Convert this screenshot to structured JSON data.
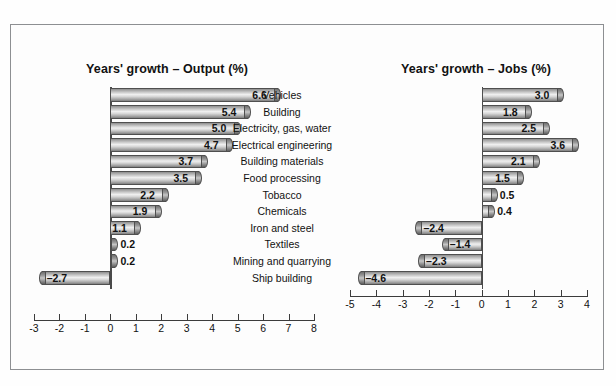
{
  "figure": {
    "background_color": "#fdfdfd",
    "frame_color": "#8d8f92",
    "bar_fill": "#cfcfcf",
    "bar_outline": "#4f4f4f"
  },
  "chart_data": [
    {
      "type": "bar",
      "orientation": "horizontal",
      "title": "Years' growth – Output (%)",
      "xlabel": "",
      "ylabel": "",
      "xlim": [
        -3,
        8
      ],
      "xticks": [
        "-3",
        "-2",
        "-1",
        "0",
        "1",
        "2",
        "3",
        "4",
        "5",
        "6",
        "7",
        "8"
      ],
      "xtick_values": [
        -3,
        -2,
        -1,
        0,
        1,
        2,
        3,
        4,
        5,
        6,
        7,
        8
      ],
      "grid": false,
      "legend": "none",
      "categories": [
        "Vehicles",
        "Building",
        "Electricity, gas, water",
        "Electrical engineering",
        "Building materials",
        "Food processing",
        "Tobacco",
        "Chemicals",
        "Iron and steel",
        "Textiles",
        "Mining and quarrying",
        "Ship building"
      ],
      "values": [
        6.6,
        5.4,
        5.0,
        4.7,
        3.7,
        3.5,
        2.2,
        1.9,
        1.1,
        0.2,
        0.2,
        -2.7
      ],
      "data_labels": [
        "6.6",
        "5.4",
        "5.0",
        "4.7",
        "3.7",
        "3.5",
        "2.2",
        "1.9",
        "1.1",
        "0.2",
        "0.2",
        "–2.7"
      ]
    },
    {
      "type": "bar",
      "orientation": "horizontal",
      "title": "Years' growth – Jobs (%)",
      "xlabel": "",
      "ylabel": "",
      "xlim": [
        -5,
        4
      ],
      "xticks": [
        "-5",
        "-4",
        "-3",
        "-2",
        "-1",
        "0",
        "1",
        "2",
        "3",
        "4"
      ],
      "xtick_values": [
        -5,
        -4,
        -3,
        -2,
        -1,
        0,
        1,
        2,
        3,
        4
      ],
      "grid": false,
      "legend": "none",
      "categories": [
        "Vehicles",
        "Building",
        "Electricity, gas, water",
        "Electrical engineering",
        "Building materials",
        "Food processing",
        "Tobacco",
        "Chemicals",
        "Iron and steel",
        "Textiles",
        "Mining and quarrying",
        "Ship building"
      ],
      "values": [
        3.0,
        1.8,
        2.5,
        3.6,
        2.1,
        1.5,
        0.5,
        0.4,
        -2.4,
        -1.4,
        -2.3,
        -4.6
      ],
      "data_labels": [
        "3.0",
        "1.8",
        "2.5",
        "3.6",
        "2.1",
        "1.5",
        "0.5",
        "0.4",
        "–2.4",
        "–1.4",
        "–2.3",
        "–4.6"
      ]
    }
  ]
}
